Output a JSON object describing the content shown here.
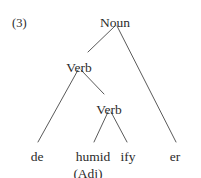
{
  "figure": {
    "example_number": "(3)",
    "line_color": "#5a5a5a",
    "text_color": "#2b2b2b",
    "background_color": "#ffffff"
  },
  "tree": {
    "nodes": {
      "root": {
        "label": "Noun",
        "x": 115,
        "y": 16
      },
      "verb_outer": {
        "label": "Verb",
        "x": 79,
        "y": 61
      },
      "verb_inner": {
        "label": "Verb",
        "x": 109,
        "y": 103
      },
      "terminal_de": {
        "label": "de",
        "x": 37,
        "y": 150
      },
      "terminal_humid": {
        "label": "humid",
        "x": 93,
        "y": 150
      },
      "terminal_ify": {
        "label": "ify",
        "x": 128,
        "y": 150
      },
      "terminal_er": {
        "label": "er",
        "x": 175,
        "y": 150
      },
      "gloss_adj": {
        "label": "(Adj)",
        "x": 88,
        "y": 167
      }
    },
    "edges": [
      {
        "from": "root",
        "to": "verb_outer",
        "x1": 115,
        "y1": 26,
        "x2": 88,
        "y2": 52
      },
      {
        "from": "root",
        "to": "terminal_er",
        "x1": 117,
        "y1": 26,
        "x2": 176,
        "y2": 142
      },
      {
        "from": "verb_outer",
        "to": "terminal_de",
        "x1": 78,
        "y1": 70,
        "x2": 38,
        "y2": 142
      },
      {
        "from": "verb_outer",
        "to": "verb_inner",
        "x1": 81,
        "y1": 70,
        "x2": 104,
        "y2": 94
      },
      {
        "from": "verb_inner",
        "to": "terminal_humid",
        "x1": 108,
        "y1": 112,
        "x2": 94,
        "y2": 142
      },
      {
        "from": "verb_inner",
        "to": "terminal_ify",
        "x1": 111,
        "y1": 112,
        "x2": 127,
        "y2": 142
      }
    ]
  }
}
